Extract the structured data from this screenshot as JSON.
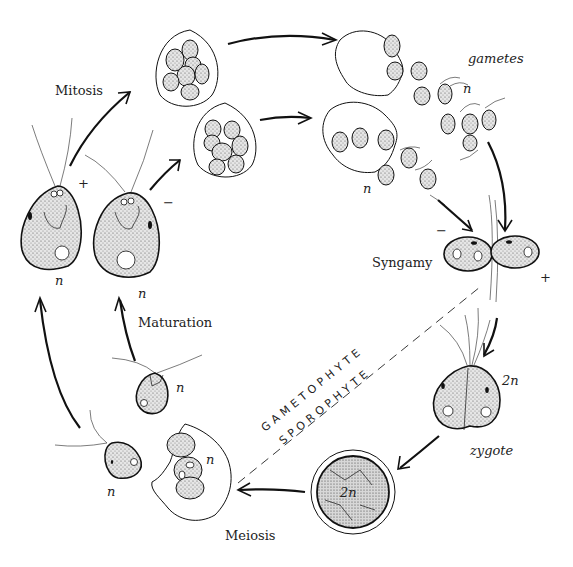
{
  "diagram": {
    "stages": {
      "mitosis": "Mitosis",
      "gametes": "gametes",
      "syngamy": "Syngamy",
      "zygote": "zygote",
      "meiosis": "Meiosis",
      "maturation": "Maturation"
    },
    "phase_divider": {
      "upper": "GAMETOPHYTE",
      "lower": "SPOROPHYTE"
    },
    "ploidy": {
      "haploid": "n",
      "diploid": "2n"
    },
    "mating_types": {
      "plus": "+",
      "minus": "−"
    }
  }
}
